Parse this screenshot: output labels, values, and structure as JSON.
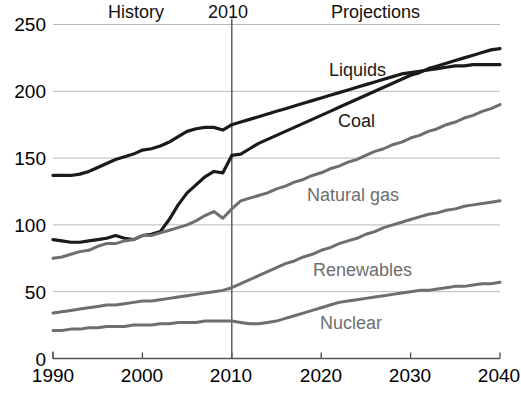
{
  "chart_data": {
    "type": "line",
    "title": "",
    "subtitle": "",
    "xlabel": "",
    "ylabel": "",
    "xlim": [
      1990,
      2040
    ],
    "ylim": [
      0,
      250
    ],
    "xticks": [
      "1990",
      "2000",
      "2010",
      "2020",
      "2030",
      "2040"
    ],
    "yticks": [
      "0",
      "50",
      "100",
      "150",
      "200",
      "250"
    ],
    "grid": "horizontal",
    "legend_position": "inline-annotations",
    "annotations": [
      {
        "text": "History",
        "x": 1999,
        "y": 252
      },
      {
        "text": "2010",
        "x": 2010,
        "y": 252
      },
      {
        "text": "Projections",
        "x": 2028,
        "y": 252
      }
    ],
    "divider_year": 2010,
    "x": [
      1990,
      1991,
      1992,
      1993,
      1994,
      1995,
      1996,
      1997,
      1998,
      1999,
      2000,
      2001,
      2002,
      2003,
      2004,
      2005,
      2006,
      2007,
      2008,
      2009,
      2010,
      2011,
      2012,
      2013,
      2014,
      2015,
      2016,
      2017,
      2018,
      2019,
      2020,
      2021,
      2022,
      2023,
      2024,
      2025,
      2026,
      2027,
      2028,
      2029,
      2030,
      2031,
      2032,
      2033,
      2034,
      2035,
      2036,
      2037,
      2038,
      2039,
      2040
    ],
    "series": [
      {
        "name": "Liquids",
        "color": "#1a1a1a",
        "width": 3.2,
        "label_x": 2021,
        "label_y": 205,
        "values": [
          137,
          137,
          137,
          138,
          140,
          143,
          146,
          149,
          151,
          153,
          156,
          157,
          159,
          162,
          166,
          170,
          172,
          173,
          173,
          171,
          175,
          177,
          179,
          181,
          183,
          185,
          187,
          189,
          191,
          193,
          195,
          197,
          199,
          201,
          203,
          205,
          207,
          209,
          211,
          213,
          214,
          215,
          216,
          217,
          218,
          219,
          219,
          220,
          220,
          220,
          220
        ]
      },
      {
        "name": "Coal",
        "color": "#1a1a1a",
        "width": 3.2,
        "label_x": 2022,
        "label_y": 150,
        "values": [
          89,
          88,
          87,
          87,
          88,
          89,
          90,
          92,
          90,
          89,
          92,
          93,
          95,
          104,
          115,
          124,
          130,
          136,
          140,
          139,
          152,
          153,
          157,
          161,
          164,
          167,
          170,
          173,
          176,
          179,
          182,
          185,
          188,
          191,
          194,
          197,
          200,
          203,
          206,
          209,
          212,
          214,
          217,
          219,
          221,
          223,
          225,
          227,
          229,
          231,
          232
        ]
      },
      {
        "name": "Natural gas",
        "color": "#6e6e6e",
        "width": 3.0,
        "label_x": 2021,
        "label_y": 108,
        "values": [
          75,
          76,
          78,
          80,
          81,
          84,
          86,
          86,
          88,
          89,
          92,
          92,
          94,
          96,
          98,
          100,
          103,
          107,
          110,
          105,
          112,
          118,
          120,
          122,
          124,
          127,
          129,
          132,
          134,
          137,
          139,
          142,
          144,
          147,
          149,
          152,
          155,
          157,
          160,
          162,
          165,
          167,
          170,
          172,
          175,
          177,
          180,
          182,
          185,
          187,
          190
        ]
      },
      {
        "name": "Renewables",
        "color": "#6e6e6e",
        "width": 3.0,
        "label_x": 2022,
        "label_y": 62,
        "values": [
          34,
          35,
          36,
          37,
          38,
          39,
          40,
          40,
          41,
          42,
          43,
          43,
          44,
          45,
          46,
          47,
          48,
          49,
          50,
          51,
          53,
          56,
          59,
          62,
          65,
          68,
          71,
          73,
          76,
          78,
          81,
          83,
          86,
          88,
          90,
          93,
          95,
          98,
          100,
          102,
          104,
          106,
          108,
          109,
          111,
          112,
          114,
          115,
          116,
          117,
          118
        ]
      },
      {
        "name": "Nuclear",
        "color": "#6e6e6e",
        "width": 3.0,
        "label_x": 2023,
        "label_y": 30,
        "values": [
          21,
          21,
          22,
          22,
          23,
          23,
          24,
          24,
          24,
          25,
          25,
          25,
          26,
          26,
          27,
          27,
          27,
          28,
          28,
          28,
          28,
          27,
          26,
          26,
          27,
          28,
          30,
          32,
          34,
          36,
          38,
          40,
          42,
          43,
          44,
          45,
          46,
          47,
          48,
          49,
          50,
          51,
          51,
          52,
          53,
          54,
          54,
          55,
          56,
          56,
          57
        ]
      }
    ]
  },
  "axis": {
    "y_ticks": [
      "250",
      "200",
      "150",
      "100",
      "50",
      "0"
    ],
    "x_ticks": [
      "1990",
      "2000",
      "2010",
      "2020",
      "2030",
      "2040"
    ]
  },
  "labels": {
    "history": "History",
    "divider_year": "2010",
    "projections": "Projections",
    "liquids": "Liquids",
    "coal": "Coal",
    "natural_gas": "Natural gas",
    "renewables": "Renewables",
    "nuclear": "Nuclear"
  },
  "colors": {
    "dark_series": "#1a1a1a",
    "gray_series": "#6e6e6e",
    "gridline": "#b8b8b8",
    "axis": "#555555",
    "background": "#ffffff"
  }
}
